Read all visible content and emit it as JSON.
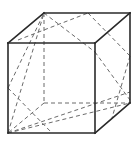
{
  "diagram": {
    "title": "",
    "type": "cube-cross-section",
    "colors": {
      "background": "#ffffff",
      "solid_edge": "#2a2a2a",
      "dashed_line": "#6a6a6a"
    },
    "vertices": {
      "A": [
        8,
        43
      ],
      "B": [
        95,
        43
      ],
      "C": [
        95,
        133
      ],
      "D": [
        8,
        133
      ],
      "E": [
        44,
        13
      ],
      "F": [
        130,
        13
      ],
      "G": [
        130,
        103
      ],
      "H": [
        44,
        103
      ]
    },
    "solid_edges": [
      [
        [
          8,
          43
        ],
        [
          95,
          43
        ]
      ],
      [
        [
          95,
          43
        ],
        [
          95,
          133
        ]
      ],
      [
        [
          95,
          133
        ],
        [
          8,
          133
        ]
      ],
      [
        [
          8,
          133
        ],
        [
          8,
          43
        ]
      ],
      [
        [
          8,
          43
        ],
        [
          44,
          13
        ]
      ],
      [
        [
          44,
          13
        ],
        [
          130,
          13
        ]
      ],
      [
        [
          130,
          13
        ],
        [
          95,
          43
        ]
      ],
      [
        [
          130,
          13
        ],
        [
          130,
          103
        ]
      ],
      [
        [
          130,
          103
        ],
        [
          95,
          133
        ]
      ]
    ],
    "dashed_lines": [
      [
        [
          44,
          13
        ],
        [
          44,
          103
        ]
      ],
      [
        [
          44,
          103
        ],
        [
          130,
          103
        ]
      ],
      [
        [
          44,
          103
        ],
        [
          8,
          133
        ]
      ],
      [
        [
          8,
          133
        ],
        [
          44,
          13
        ]
      ],
      [
        [
          8,
          88
        ],
        [
          44,
          13
        ]
      ],
      [
        [
          18,
          40
        ],
        [
          88,
          13
        ]
      ],
      [
        [
          44,
          13
        ],
        [
          95,
          52
        ]
      ],
      [
        [
          88,
          13
        ],
        [
          130,
          56
        ]
      ],
      [
        [
          130,
          56
        ],
        [
          112,
          118
        ]
      ],
      [
        [
          8,
          133
        ],
        [
          130,
          103
        ]
      ],
      [
        [
          8,
          133
        ],
        [
          130,
          92
        ]
      ],
      [
        [
          8,
          88
        ],
        [
          52,
          133
        ]
      ],
      [
        [
          95,
          52
        ],
        [
          130,
          100
        ]
      ]
    ]
  }
}
